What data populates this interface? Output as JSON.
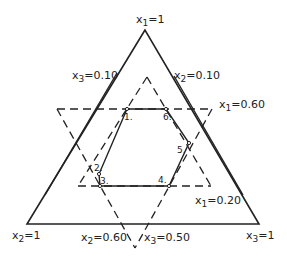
{
  "diagram": {
    "type": "ternary simplex with constraint lines",
    "vertices": {
      "top": {
        "var": "x",
        "sub": "1",
        "val": "=1"
      },
      "bottom_left": {
        "var": "x",
        "sub": "2",
        "val": "=1"
      },
      "bottom_right": {
        "var": "x",
        "sub": "3",
        "val": "=1"
      }
    },
    "constraints": [
      {
        "var": "x",
        "sub": "3",
        "val": "=0.10"
      },
      {
        "var": "x",
        "sub": "2",
        "val": "=0.10"
      },
      {
        "var": "x",
        "sub": "1",
        "val": "=0.60"
      },
      {
        "var": "x",
        "sub": "1",
        "val": "=0.20"
      },
      {
        "var": "x",
        "sub": "2",
        "val": "=0.60"
      },
      {
        "var": "x",
        "sub": "3",
        "val": "=0.50"
      }
    ],
    "points": [
      "1.",
      "2.",
      "3.",
      "4.",
      "5.",
      "6."
    ],
    "colors": {
      "line": "#222222",
      "background": "#ffffff"
    }
  }
}
